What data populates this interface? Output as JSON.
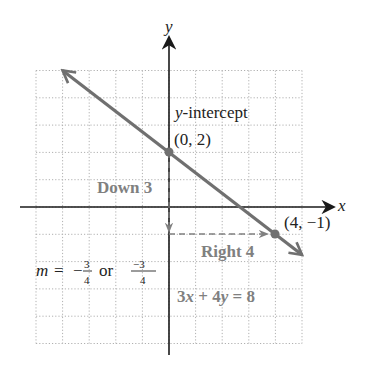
{
  "chart_data": {
    "type": "line",
    "title": "",
    "xlabel": "x",
    "ylabel": "y",
    "xlim": [
      -5,
      5
    ],
    "ylim": [
      -5,
      5
    ],
    "grid": true,
    "grid_style": "dotted",
    "series": [
      {
        "name": "3x + 4y = 8",
        "equation": "3x + 4y = 8",
        "slope": -0.75,
        "intercept": 2,
        "x": [
          -4,
          0,
          4,
          5
        ],
        "y": [
          5,
          2,
          -1,
          -1.75
        ],
        "color": "#707070"
      }
    ],
    "points": [
      {
        "label": "(0, 2)",
        "x": 0,
        "y": 2,
        "annotation": "y-intercept"
      },
      {
        "label": "(4, −1)",
        "x": 4,
        "y": -1
      }
    ],
    "annotations": {
      "intercept_title": "y-intercept",
      "intercept_coords": "(0, 2)",
      "point2_coords": "(4, −1)",
      "rise_label": "Down 3",
      "run_label": "Right 4",
      "slope_prefix": "m = ",
      "slope_neg": "−",
      "slope_num": "3",
      "slope_den": "4",
      "slope_or": "or",
      "slope_alt_num": "−3",
      "slope_alt_den": "4",
      "equation": "3x + 4y = 8"
    }
  },
  "axes": {
    "x_label": "x",
    "y_label": "y"
  },
  "colors": {
    "line": "#707070",
    "axis": "#1a1a1a",
    "grid": "#b0b0b0",
    "annotation_gray": "#808080",
    "text": "#222222"
  }
}
